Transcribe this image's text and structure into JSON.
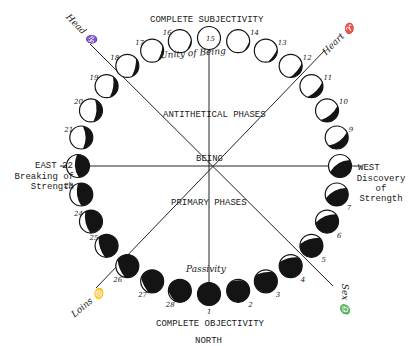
{
  "diagram": {
    "title_top": "COMPLETE SUBJECTIVITY",
    "title_bottom": "COMPLETE OBJECTIVITY",
    "direction_bottom": "NORTH",
    "center_label": "BEING",
    "upper_half_label": "ANTITHETICAL PHASES",
    "lower_half_label": "PRIMARY PHASES",
    "top_handwritten": "Unity of Being",
    "bottom_handwritten": "Passivity",
    "east": {
      "label": "EAST",
      "phase": "22",
      "caption_line1": "Breaking of",
      "caption_line2": "Strength"
    },
    "west": {
      "label": "WEST",
      "phase": "8",
      "caption_line1": "Discovery",
      "caption_line2": "of",
      "caption_line3": "Strength"
    },
    "axis_labels": {
      "top_left": {
        "text": "Head",
        "symbol": "♑"
      },
      "top_right": {
        "text": "Heart",
        "symbol": "♈"
      },
      "bottom_left": {
        "text": "Loins",
        "symbol": "♋"
      },
      "bottom_right": {
        "text": "Sex",
        "symbol": "♎"
      }
    },
    "phases": [
      {
        "n": 1,
        "label": "1",
        "dark": 1.0
      },
      {
        "n": 2,
        "label": "2",
        "dark": 0.93
      },
      {
        "n": 3,
        "label": "3",
        "dark": 0.86
      },
      {
        "n": 4,
        "label": "4",
        "dark": 0.79
      },
      {
        "n": 5,
        "label": "5",
        "dark": 0.72
      },
      {
        "n": 6,
        "label": "6",
        "dark": 0.64
      },
      {
        "n": 7,
        "label": "7",
        "dark": 0.57
      },
      {
        "n": 8,
        "label": "8",
        "dark": 0.5
      },
      {
        "n": 9,
        "label": "9",
        "dark": 0.43
      },
      {
        "n": 10,
        "label": "10",
        "dark": 0.36
      },
      {
        "n": 11,
        "label": "11",
        "dark": 0.29
      },
      {
        "n": 12,
        "label": "12",
        "dark": 0.21
      },
      {
        "n": 13,
        "label": "13",
        "dark": 0.14
      },
      {
        "n": 14,
        "label": "14",
        "dark": 0.07
      },
      {
        "n": 15,
        "label": "15",
        "dark": 0.0
      },
      {
        "n": 16,
        "label": "16",
        "dark": 0.07
      },
      {
        "n": 17,
        "label": "17",
        "dark": 0.14
      },
      {
        "n": 18,
        "label": "18",
        "dark": 0.21
      },
      {
        "n": 19,
        "label": "19",
        "dark": 0.29
      },
      {
        "n": 20,
        "label": "20",
        "dark": 0.36
      },
      {
        "n": 21,
        "label": "21",
        "dark": 0.43
      },
      {
        "n": 22,
        "label": "22",
        "dark": 0.5
      },
      {
        "n": 23,
        "label": "23",
        "dark": 0.57
      },
      {
        "n": 24,
        "label": "24",
        "dark": 0.64
      },
      {
        "n": 25,
        "label": "25",
        "dark": 0.72
      },
      {
        "n": 26,
        "label": "26",
        "dark": 0.79
      },
      {
        "n": 27,
        "label": "27",
        "dark": 0.86
      },
      {
        "n": 28,
        "label": "28",
        "dark": 0.93
      }
    ],
    "colors": {
      "ink": "#141414",
      "paper": "#ffffff"
    }
  }
}
